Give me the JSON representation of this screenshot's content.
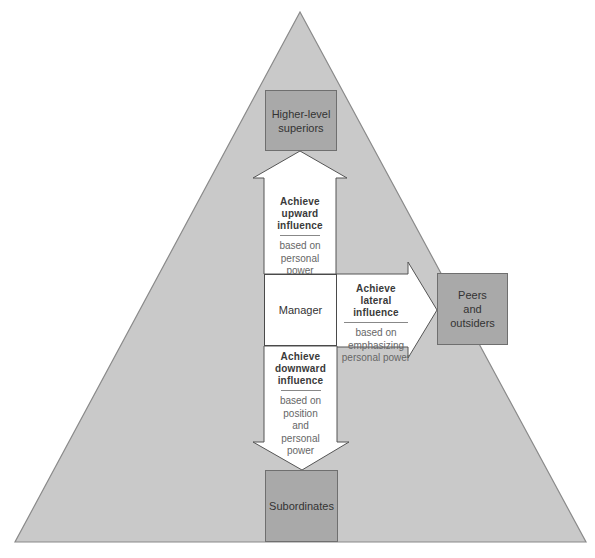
{
  "colors": {
    "triangle_fill": "#c9c9c9",
    "triangle_stroke": "#8a8a8a",
    "box_fill": "#a9a9a9",
    "arrow_fill": "#ffffff"
  },
  "nodes": {
    "superiors": "Higher-level superiors",
    "superiors_lines": [
      "Higher-level",
      "superiors"
    ],
    "manager": "Manager",
    "peers_lines": [
      "Peers",
      "and",
      "outsiders"
    ],
    "subordinates": "Subordinates"
  },
  "arrows": {
    "upward": {
      "title_lines": [
        "Achieve",
        "upward",
        "influence"
      ],
      "basis_lines": [
        "based on",
        "personal",
        "power"
      ]
    },
    "lateral": {
      "title_lines": [
        "Achieve",
        "lateral influence"
      ],
      "basis_lines": [
        "based on",
        "emphasizing",
        "personal power"
      ]
    },
    "downward": {
      "title_lines": [
        "Achieve",
        "downward",
        "influence"
      ],
      "basis_lines": [
        "based on",
        "position",
        "and",
        "personal",
        "power"
      ]
    }
  }
}
